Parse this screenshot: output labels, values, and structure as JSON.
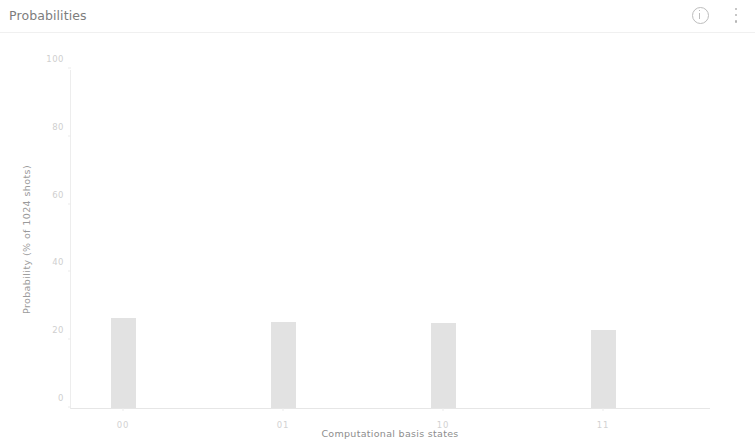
{
  "header": {
    "title": "Probabilities",
    "info_icon": "info-circle-icon",
    "menu_icon": "more-vertical-icon"
  },
  "chart_data": {
    "type": "bar",
    "title": "Probabilities",
    "categories": [
      "00",
      "01",
      "10",
      "11"
    ],
    "values": [
      26.5,
      25.5,
      25.0,
      23.0
    ],
    "xlabel": "Computational basis states",
    "ylabel": "Probability (% of 1024 shots)",
    "ylim": [
      0,
      100
    ],
    "yticks": [
      0,
      20,
      40,
      60,
      80,
      100
    ],
    "ytick_labels": [
      "0",
      "20",
      "40",
      "60",
      "80",
      "100"
    ],
    "grid": false,
    "legend": null,
    "bar_color": "#e2e2e2",
    "axis_color": "#e6e6e6",
    "shots": 1024
  }
}
